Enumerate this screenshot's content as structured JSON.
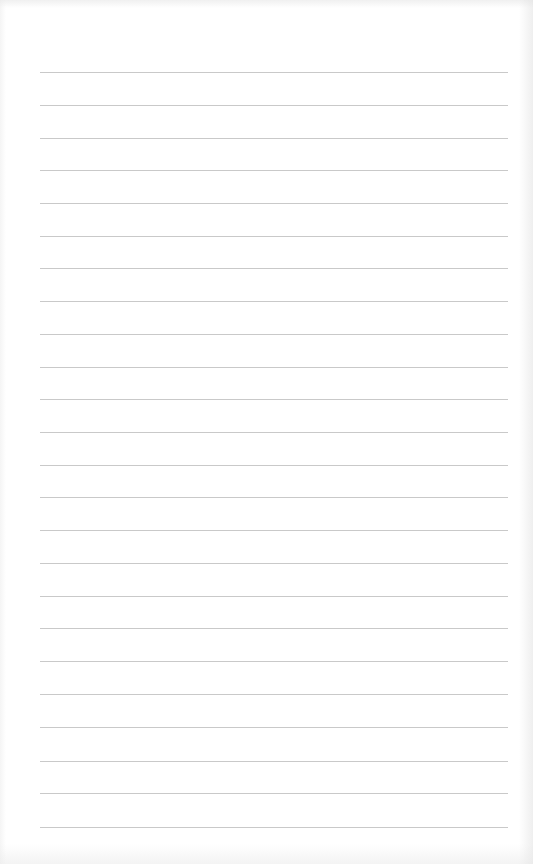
{
  "document": {
    "type": "lined-paper",
    "background_color": "#ffffff",
    "rule_color": "#c9c9c9",
    "rule_count": 24,
    "rule_left_px": 40,
    "rule_right_px": 508,
    "rule_positions_px": [
      72,
      105,
      138,
      170,
      203,
      236,
      268,
      301,
      334,
      367,
      399,
      432,
      465,
      497,
      530,
      563,
      596,
      628,
      661,
      694,
      727,
      761,
      793,
      827
    ],
    "text_content": []
  }
}
